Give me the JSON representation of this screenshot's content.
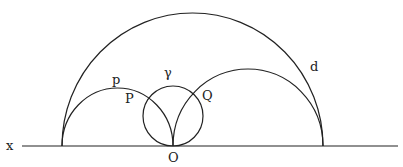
{
  "diagram": {
    "labels": {
      "x": "x",
      "O": "O",
      "p": "p",
      "P": "P",
      "gamma": "γ",
      "Q": "Q",
      "d": "d"
    },
    "colors": {
      "stroke": "#222222",
      "background": "#ffffff"
    }
  }
}
